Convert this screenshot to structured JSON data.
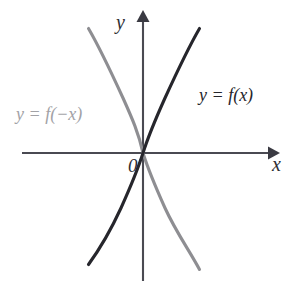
{
  "figure": {
    "background_color": "#ffffff",
    "axes": {
      "x_axis_label": "x",
      "y_axis_label": "y",
      "origin_label": "0",
      "axis_color": "#4a4a52",
      "x_axis_y_pixel": 153,
      "y_axis_x_pixel": 143,
      "x_axis_extent_px": [
        22,
        275
      ],
      "y_axis_extent_px": [
        15,
        281
      ],
      "arrow_directions": [
        "up",
        "right"
      ]
    },
    "labels": {
      "function_label": "y = f(x)",
      "reflection_label": "y = f(−x)"
    }
  },
  "chart_data": {
    "type": "line",
    "title": "",
    "subtitle": "",
    "xlabel": "x",
    "ylabel": "y",
    "xlim": [
      -1.6,
      1.6
    ],
    "ylim": [
      -3.2,
      3.2
    ],
    "grid": false,
    "legend": "inline-annotations",
    "annotations": [
      {
        "text": "y = f(x)",
        "color": "#26262c",
        "x_px": 199,
        "y_px": 86
      },
      {
        "text": "y = f(−x)",
        "color": "#a2a2a6",
        "x_px": 16,
        "y_px": 105
      },
      {
        "text": "0",
        "color": "#2e2e34",
        "x_px": 128,
        "y_px": 156
      },
      {
        "text": "y",
        "color": "#2e2e34",
        "x_px": 116,
        "y_px": 12
      },
      {
        "text": "x",
        "color": "#2e2e34",
        "x_px": 272,
        "y_px": 154
      }
    ],
    "series": [
      {
        "name": "y = f(x)",
        "color": "#26262c",
        "description": "odd increasing curve through origin, steep away from origin, passes through quadrants I and III",
        "path": "M 88.5,264.5 C 99,250 110,232 121,208 C 130,188 137,172 143,153 C 149,134 156,118 165,98 C 176,74 187,50 199.5,28.5"
      },
      {
        "name": "y = f(−x)",
        "color": "#8e8e92",
        "description": "mirror image of y = f(x) about the y axis, passes through quadrants II and IV",
        "path": "M 88.5,28.5 C 101,50 112,74 123,98 C 132,118 139,134 143,153 C 149,172 156,188 165,208 C 176,232 189,250 199.5,269.5"
      }
    ]
  }
}
